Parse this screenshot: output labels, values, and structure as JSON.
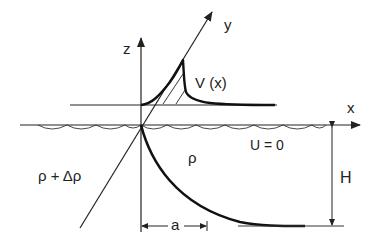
{
  "diagram": {
    "axes": {
      "x_label": "x",
      "y_label": "y",
      "z_label": "z"
    },
    "labels": {
      "velocity": "V (x)",
      "current": "U = 0",
      "upper_density": "ρ",
      "lower_density": "ρ + Δρ",
      "depth": "H",
      "width": "a"
    },
    "colors": {
      "line": "#222222",
      "background": "#ffffff"
    }
  }
}
